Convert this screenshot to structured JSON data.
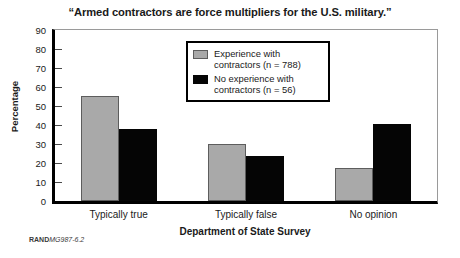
{
  "chart_data": {
    "type": "bar",
    "title": "“Armed contractors are force multipliers for the U.S. military.”",
    "xlabel": "Department of State Survey",
    "ylabel": "Percentage",
    "categories": [
      "Typically true",
      "Typically false",
      "No opinion"
    ],
    "series": [
      {
        "name": "Experience with contractors (n = 788)",
        "color": "#a9a9a9",
        "values": [
          55.5,
          30,
          17.5
        ]
      },
      {
        "name": "No experience with contractors (n = 56)",
        "color": "#050505",
        "values": [
          38,
          23.5,
          40.5
        ]
      }
    ],
    "ylim": [
      0,
      90
    ],
    "yticks": [
      0,
      10,
      20,
      30,
      40,
      50,
      60,
      70,
      80,
      90
    ],
    "ytick_labels": [
      "0",
      "10",
      "20",
      "30",
      "40",
      "50",
      "60",
      "70",
      "80",
      "90"
    ],
    "grid": false,
    "legend_position": "top-center"
  },
  "legend": {
    "entries": [
      {
        "swatch": "gray-swatch",
        "line1": "Experience with",
        "line2": "contractors (n = 788)"
      },
      {
        "swatch": "black-swatch",
        "line1": "No experience with",
        "line2": "contractors (n = 56)"
      }
    ]
  },
  "footnote": {
    "source": "RAND",
    "document_id": "MG987-6.2"
  }
}
